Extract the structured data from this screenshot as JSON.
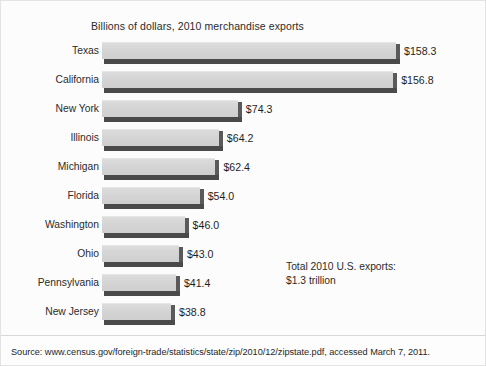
{
  "figure": {
    "title": "Billions of dollars, 2010 merchandise exports",
    "annotation_line1": "Total 2010 U.S. exports:",
    "annotation_line2": "$1.3 trillion",
    "source": "Source: www.census.gov/foreign-trade/statistics/state/zip/2010/12/zipstate.pdf, accessed March 7, 2011.",
    "colors": {
      "bar_face": "#d4d4d4",
      "bar_shadow": "#4a4a4a",
      "background": "#fcfcfc",
      "text": "#2b2b2b",
      "border": "#e3e3e3"
    }
  },
  "chart_data": {
    "type": "bar",
    "orientation": "horizontal",
    "title": "Billions of dollars, 2010 merchandise exports",
    "xlabel": "",
    "ylabel": "",
    "grid": false,
    "legend": false,
    "xlim": [
      0,
      158.3
    ],
    "units": "billions of dollars",
    "categories": [
      "Texas",
      "California",
      "New York",
      "Illinois",
      "Michigan",
      "Florida",
      "Washington",
      "Ohio",
      "Pennsylvania",
      "New Jersey"
    ],
    "values": [
      158.3,
      156.8,
      74.3,
      64.2,
      62.4,
      54.0,
      46.0,
      43.0,
      41.4,
      38.8
    ],
    "value_labels": [
      "$158.3",
      "$156.8",
      "$74.3",
      "$64.2",
      "$62.4",
      "$54.0",
      "$46.0",
      "$43.0",
      "$41.4",
      "$38.8"
    ],
    "annotations": [
      "Total 2010 U.S. exports:",
      "$1.3 trillion"
    ]
  }
}
